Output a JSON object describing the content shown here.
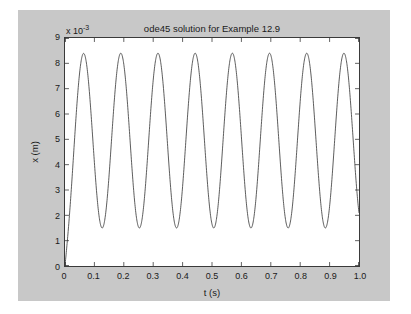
{
  "figure": {
    "background_color": "#c8c8c8",
    "axes_background_color": "#ffffff",
    "axes_edge_color": "#3a3a3a",
    "line_color": "#333333"
  },
  "bleed_text": "                 The  residual  is  calculated  by  subtraction\n           and  then  the  solution  is  plotted.\n\n\n\n       by  the  method  of  undetermined  coefficients  so  that\n       the  particular  solution  may  be  written  as  shown\n\n\n       where  the  constants  are  determined  from  the  initial\n       conditions  of  the  problem  as  described  above\n       and  the  resulting  expression  is  substituted  into\n       the  governing  equation.",
  "chart_data": {
    "type": "line",
    "title": "ode45 solution for Example 12.9",
    "xlabel": "t (s)",
    "ylabel": "x (m)",
    "y_exponent_label": "x 10",
    "y_exponent_value": "-3",
    "xlim": [
      0,
      1.0
    ],
    "ylim": [
      0,
      9
    ],
    "grid": false,
    "legend": null,
    "xticks": [
      "0",
      "0.1",
      "0.2",
      "0.3",
      "0.4",
      "0.5",
      "0.6",
      "0.7",
      "0.8",
      "0.9",
      "1.0"
    ],
    "xtick_values": [
      0,
      0.1,
      0.2,
      0.3,
      0.4,
      0.5,
      0.6,
      0.7,
      0.8,
      0.9,
      1.0
    ],
    "yticks": [
      "0",
      "1",
      "2",
      "3",
      "4",
      "5",
      "6",
      "7",
      "8",
      "9"
    ],
    "ytick_values": [
      0,
      1,
      2,
      3,
      4,
      5,
      6,
      7,
      8,
      9
    ],
    "series": [
      {
        "name": "x(t)",
        "units": "m",
        "scale": "1e-3",
        "description": "Step response of a lightly damped second-order system: starts at 0, rises to first peak then oscillates about a steady-state mean.",
        "mean_level": 4.95,
        "amplitude": 3.45,
        "period_s": 0.1265,
        "frequency_hz": 7.905,
        "n_cycles_shown": 8,
        "peak_value": 8.4,
        "trough_value": 1.5,
        "start_value": 0.0,
        "peak_times": [
          0.082,
          0.209,
          0.335,
          0.462,
          0.588,
          0.715,
          0.841,
          0.968
        ],
        "trough_times": [
          0.145,
          0.272,
          0.398,
          0.525,
          0.651,
          0.778,
          0.905
        ]
      }
    ]
  }
}
